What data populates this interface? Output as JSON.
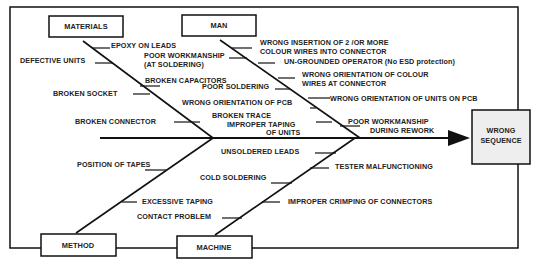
{
  "diagram": {
    "type": "fishbone",
    "effect": "WRONG SEQUENCE",
    "effect_lines": [
      "WRONG",
      "SEQUENCE"
    ],
    "categories": {
      "materials": {
        "label": "MATERIALS",
        "causes": [
          "EPOXY ON LEADS",
          "DEFECTIVE UNITS",
          "BROKEN CAPACITORS",
          "BROKEN SOCKET",
          "BROKEN CONNECTOR"
        ]
      },
      "man": {
        "label": "MAN",
        "causes": [
          "WRONG INSERTION OF 2 /OR MORE",
          "COLOUR WIRES INTO CONNECTOR",
          "POOR WORKMANSHIP",
          "(AT SOLDERING)",
          "UN-GROUNDED  OPERATOR (No ESD protection)",
          "WRONG ORIENTATION OF COLOUR",
          "WIRES AT CONNECTOR",
          "POOR SOLDERING",
          "WRONG ORIENTATION OF PCB",
          "WRONG ORIENTATION OF UNITS ON PCB",
          "BROKEN TRACE",
          "IMPROPER TAPING",
          "OF UNITS",
          "POOR WORKMANSHIP",
          "DURING REWORK"
        ]
      },
      "method": {
        "label": "METHOD",
        "causes": [
          "POSITION OF TAPES",
          "EXCESSIVE TAPING",
          "CONTACT PROBLEM"
        ]
      },
      "machine": {
        "label": "MACHINE",
        "causes": [
          "UNSOLDERED LEADS",
          "TESTER MALFUNCTIONING",
          "COLD SOLDERING",
          "IMPROPER CRIMPING OF CONNECTORS"
        ]
      }
    },
    "colors": {
      "line": "#111111",
      "text": "#222222",
      "effect_fill": "#eeeeee",
      "background": "#ffffff"
    }
  }
}
